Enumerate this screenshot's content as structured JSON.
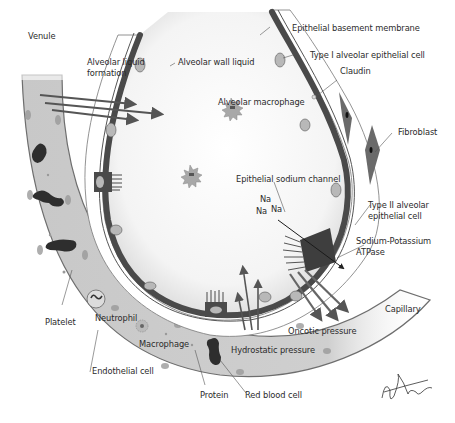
{
  "diagram": {
    "labels": {
      "venule": "Venule",
      "alveolar_liquid_formation_1": "Alveolar liquid",
      "alveolar_liquid_formation_2": "formation",
      "alveolar_wall_liquid": "Alveolar wall liquid",
      "epithelial_basement_membrane": "Epithelial basement membrane",
      "type1_cell": "Type I alveolar epithelial cell",
      "claudin": "Claudin",
      "alveolar_macrophage": "Alveolar macrophage",
      "fibroblast": "Fibroblast",
      "epithelial_sodium_channel": "Epithelial sodium channel",
      "na_1": "Na",
      "na_2": "Na",
      "na_3": "Na",
      "type2_cell_1": "Type II alveolar",
      "type2_cell_2": "epithelial cell",
      "na_k_atpase_1": "Sodium-Potassium",
      "na_k_atpase_2": "ATPase",
      "capillary": "Capillary",
      "oncotic_pressure": "Oncotic pressure",
      "hydrostatic_pressure": "Hydrostatic pressure",
      "platelet": "Platelet",
      "neutrophil": "Neutrophil",
      "macrophage": "Macrophage",
      "endothelial_cell": "Endothelial cell",
      "protein": "Protein",
      "red_blood_cell": "Red blood cell"
    },
    "signature": "M. Stewart",
    "colors": {
      "vessel_fill": "#c9c9c9",
      "vessel_edge": "#6e6e6e",
      "epithelium": "#4a4a4a",
      "nucleus": "#b8b8b8",
      "rbc": "#2e2e2e",
      "arrow": "#5a5a5a",
      "text": "#2b2b2b"
    }
  }
}
